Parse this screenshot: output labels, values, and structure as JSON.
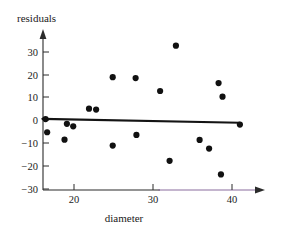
{
  "chart_data": {
    "type": "scatter",
    "title": "",
    "xlabel": "diameter",
    "ylabel": "residuals",
    "xlim": [
      15.5,
      43.5
    ],
    "ylim": [
      -30,
      36
    ],
    "xticks": [
      20,
      30,
      40
    ],
    "xtick_labels": [
      "20",
      "30",
      "40"
    ],
    "yticks": [
      -30,
      -20,
      -10,
      0,
      10,
      20,
      30
    ],
    "ytick_labels": [
      "−30",
      "−20",
      "−10",
      "0",
      "10",
      "20",
      "30"
    ],
    "grid": false,
    "legend": null,
    "series": [
      {
        "name": "residuals",
        "marker": "filled-circle",
        "color": "#111111",
        "points": [
          {
            "x": 16.4,
            "y": 0.4
          },
          {
            "x": 16.6,
            "y": -5.4
          },
          {
            "x": 18.8,
            "y": -8.7
          },
          {
            "x": 19.1,
            "y": -1.7
          },
          {
            "x": 19.9,
            "y": -2.8
          },
          {
            "x": 21.9,
            "y": 5.0
          },
          {
            "x": 22.8,
            "y": 4.6
          },
          {
            "x": 24.9,
            "y": 18.9
          },
          {
            "x": 24.9,
            "y": -11.3
          },
          {
            "x": 27.8,
            "y": 18.5
          },
          {
            "x": 27.9,
            "y": -6.6
          },
          {
            "x": 30.9,
            "y": 12.8
          },
          {
            "x": 32.1,
            "y": -18.0
          },
          {
            "x": 32.9,
            "y": 32.8
          },
          {
            "x": 35.9,
            "y": -8.8
          },
          {
            "x": 37.1,
            "y": -12.6
          },
          {
            "x": 38.3,
            "y": 16.3
          },
          {
            "x": 38.6,
            "y": -24.0
          },
          {
            "x": 38.8,
            "y": 10.3
          },
          {
            "x": 41.0,
            "y": -2.0
          }
        ]
      }
    ],
    "fit_line": {
      "name": "least-squares-residual-line",
      "color": "#141414",
      "x_start": 16.0,
      "y_start": 0.5,
      "x_end": 41.0,
      "y_end": -1.2
    }
  },
  "axes": {
    "y_axis_label": "residuals",
    "x_axis_label": "diameter",
    "y_axis_arrow": "arrow-up",
    "x_axis_arrow": "arrow-right"
  }
}
